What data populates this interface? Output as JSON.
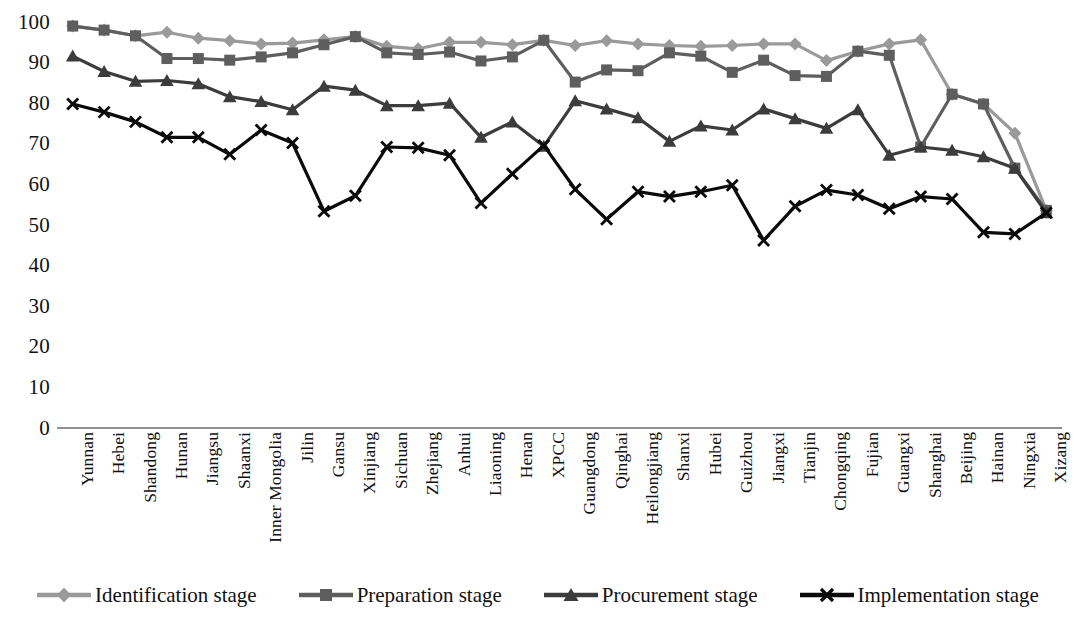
{
  "chart_data": {
    "type": "line",
    "title": "",
    "subtitle": "",
    "xlabel": "",
    "ylabel": "",
    "ylim": [
      0,
      100
    ],
    "ytick_step": 10,
    "yticks": [
      100,
      90,
      80,
      70,
      60,
      50,
      40,
      30,
      20,
      10,
      0
    ],
    "grid": false,
    "legend_position": "bottom",
    "categories": [
      "Yunnan",
      "Hebei",
      "Shandong",
      "Hunan",
      "Jiangsu",
      "Shaanxi",
      "Inner Mongolia",
      "Jilin",
      "Gansu",
      "Xinjiang",
      "Sichuan",
      "Zhejiang",
      "Anhui",
      "Liaoning",
      "Henan",
      "XPCC",
      "Guangdong",
      "Qinghai",
      "Heilongjiang",
      "Shanxi",
      "Hubei",
      "Guizhou",
      "Jiangxi",
      "Tianjin",
      "Chongqing",
      "Fujian",
      "Guangxi",
      "Shanghai",
      "Beijing",
      "Hainan",
      "Ningxia",
      "Xizang"
    ],
    "series": [
      {
        "name": "Identification stage",
        "color": "#9a9a9a",
        "marker": "diamond",
        "values": [
          99.0,
          98.0,
          96.6,
          97.5,
          96.0,
          95.4,
          94.6,
          94.8,
          95.6,
          96.4,
          94.0,
          93.4,
          95.0,
          95.0,
          94.4,
          95.5,
          94.2,
          95.4,
          94.6,
          94.2,
          94.0,
          94.2,
          94.6,
          94.6,
          90.5,
          92.8,
          94.6,
          95.6,
          82.2,
          79.8,
          72.6,
          53.6
        ]
      },
      {
        "name": "Preparation stage",
        "color": "#5e5e5e",
        "marker": "square",
        "values": [
          99.0,
          98.0,
          96.6,
          91.0,
          91.0,
          90.6,
          91.4,
          92.4,
          94.4,
          96.4,
          92.4,
          92.0,
          92.6,
          90.4,
          91.4,
          95.5,
          85.2,
          88.2,
          88.0,
          92.4,
          91.6,
          87.6,
          90.6,
          86.8,
          86.6,
          92.8,
          91.8,
          69.2,
          82.2,
          79.8,
          64.0,
          53.6
        ]
      },
      {
        "name": "Procurement stage",
        "color": "#3c3c3c",
        "marker": "triangle",
        "values": [
          91.6,
          87.8,
          85.4,
          85.6,
          84.8,
          81.6,
          80.4,
          78.4,
          84.2,
          83.2,
          79.4,
          79.4,
          80.0,
          71.6,
          75.4,
          69.4,
          80.6,
          78.6,
          76.4,
          70.6,
          74.4,
          73.4,
          78.6,
          76.2,
          73.8,
          78.4,
          67.2,
          69.2,
          68.4,
          66.8,
          64.0,
          53.0
        ]
      },
      {
        "name": "Implementation stage",
        "color": "#0a0a0a",
        "marker": "x",
        "values": [
          79.8,
          77.8,
          75.4,
          71.6,
          71.6,
          67.4,
          73.4,
          70.2,
          53.4,
          57.2,
          69.2,
          69.0,
          67.2,
          55.4,
          62.6,
          69.6,
          58.8,
          51.4,
          58.2,
          57.0,
          58.2,
          59.8,
          46.2,
          54.6,
          58.6,
          57.4,
          54.0,
          57.0,
          56.4,
          48.2,
          47.8,
          53.0
        ]
      }
    ]
  },
  "legend": {
    "items": [
      {
        "label": "Identification stage"
      },
      {
        "label": "Preparation stage"
      },
      {
        "label": "Procurement stage"
      },
      {
        "label": "Implementation stage"
      }
    ]
  },
  "caption": {
    "text": ""
  }
}
